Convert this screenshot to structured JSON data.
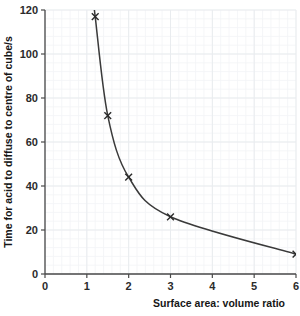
{
  "chart_data": {
    "type": "line",
    "title": "",
    "xlabel": "Surface area: volume ratio",
    "ylabel": "Time for acid to diffuse to centre of cube/s",
    "x": [
      1.2,
      1.5,
      2.0,
      3.0,
      6.0
    ],
    "values": [
      117,
      72,
      44,
      26,
      9
    ],
    "series": [
      {
        "name": "Time for acid to diffuse to centre of cube",
        "x": [
          1.2,
          1.5,
          2.0,
          3.0,
          6.0
        ],
        "values": [
          117,
          72,
          44,
          26,
          9
        ]
      }
    ],
    "points": [
      {
        "x": 1.2,
        "y": 117
      },
      {
        "x": 1.5,
        "y": 72
      },
      {
        "x": 2.0,
        "y": 44
      },
      {
        "x": 3.0,
        "y": 26
      },
      {
        "x": 6.0,
        "y": 9
      }
    ],
    "xlim": [
      0,
      6
    ],
    "ylim": [
      0,
      120
    ],
    "xticks": [
      0,
      1,
      2,
      3,
      4,
      5,
      6
    ],
    "yticks": [
      0,
      20,
      40,
      60,
      80,
      100,
      120
    ],
    "xtick_labels": [
      "0",
      "1",
      "2",
      "3",
      "4",
      "5",
      "6"
    ],
    "ytick_labels": [
      "0",
      "20",
      "40",
      "60",
      "80",
      "100",
      "120"
    ],
    "grid": true,
    "grid_minor": true,
    "legend": false,
    "legend_position": "none",
    "marker": "x-cross",
    "line_color": "#3a3a3a",
    "marker_color": "#2a2a2a",
    "grid_color": "#e9ecef",
    "grid_minor_color": "#f3f4f6",
    "axis_color": "#4a4a4a",
    "background_color": "#ffffff"
  },
  "axes": {
    "x_title": "Surface area: volume ratio",
    "y_title": "Time for acid to diffuse to centre of cube/s"
  }
}
